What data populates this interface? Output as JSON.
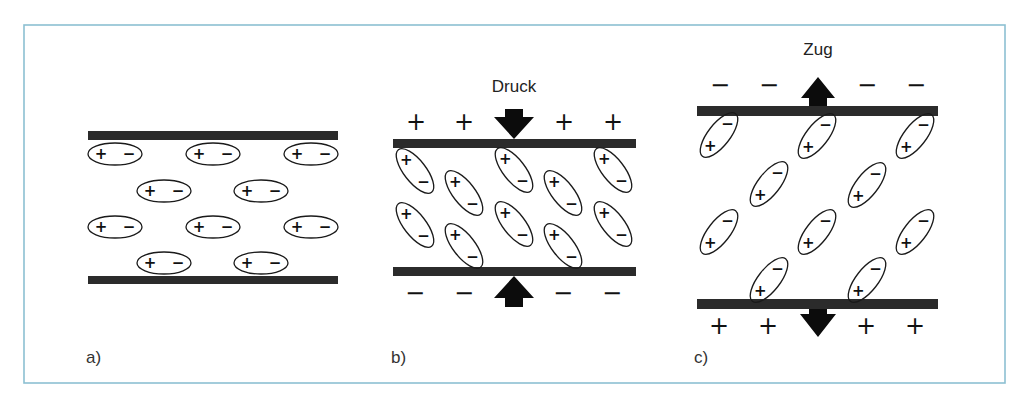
{
  "frame": {
    "x": 24,
    "y": 25,
    "width": 981,
    "height": 358,
    "color": "#8cc0d2"
  },
  "ellipse": {
    "rx": 27,
    "ry": 11,
    "tilted_rx": 27,
    "tilted_ry": 11
  },
  "panels": [
    {
      "id": "a",
      "label": "a)",
      "label_pos": [
        86,
        363
      ],
      "force_label": "",
      "plates": [
        {
          "x": 88,
          "y": 131,
          "w": 250,
          "h": 9
        },
        {
          "x": 88,
          "y": 276,
          "w": 250,
          "h": 8
        }
      ],
      "dipole_angle": 0,
      "dipole_order": [
        "+",
        "−"
      ],
      "dipoles": [
        [
          115,
          154
        ],
        [
          213,
          154
        ],
        [
          311,
          154
        ],
        [
          164,
          191
        ],
        [
          261,
          191
        ],
        [
          115,
          227
        ],
        [
          213,
          227
        ],
        [
          311,
          227
        ],
        [
          164,
          263
        ],
        [
          261,
          263
        ]
      ],
      "outer_top": [],
      "outer_bottom": [],
      "arrows": []
    },
    {
      "id": "b",
      "label": "b)",
      "label_pos": [
        391,
        363
      ],
      "force_label": "Druck",
      "force_label_pos": [
        514,
        92
      ],
      "plates": [
        {
          "x": 393,
          "y": 139,
          "w": 243,
          "h": 9
        },
        {
          "x": 393,
          "y": 267,
          "w": 243,
          "h": 9
        }
      ],
      "dipole_angle": 52,
      "dipole_order": [
        "+",
        "−"
      ],
      "dipoles": [
        [
          415,
          171
        ],
        [
          514,
          170
        ],
        [
          613,
          170
        ],
        [
          464,
          193
        ],
        [
          563,
          193
        ],
        [
          415,
          225
        ],
        [
          514,
          224
        ],
        [
          613,
          224
        ],
        [
          464,
          246
        ],
        [
          563,
          246
        ]
      ],
      "outer_top": {
        "symbol": "+",
        "y": 122,
        "xs": [
          416,
          464,
          564,
          613
        ]
      },
      "outer_bottom": {
        "symbol": "−",
        "y": 293,
        "xs": [
          415,
          464,
          563,
          612
        ]
      },
      "arrows": [
        {
          "direction": "down",
          "x": 514,
          "shaft_top": 109,
          "head_top": 117,
          "tip": 139,
          "shaft_half": 9,
          "head_half": 20
        },
        {
          "direction": "up",
          "x": 514,
          "shaft_bottom": 307,
          "head_bottom": 298,
          "tip": 276,
          "shaft_half": 9,
          "head_half": 20
        }
      ]
    },
    {
      "id": "c",
      "label": "c)",
      "label_pos": [
        694,
        363
      ],
      "force_label": "Zug",
      "force_label_pos": [
        818,
        55
      ],
      "plates": [
        {
          "x": 697,
          "y": 106,
          "w": 241,
          "h": 10
        },
        {
          "x": 697,
          "y": 299,
          "w": 241,
          "h": 10
        }
      ],
      "dipole_angle": -52,
      "dipole_order": [
        "+",
        "−"
      ],
      "dipoles": [
        [
          719,
          135
        ],
        [
          817,
          136
        ],
        [
          915,
          136
        ],
        [
          769,
          184
        ],
        [
          867,
          185
        ],
        [
          719,
          232
        ],
        [
          817,
          232
        ],
        [
          915,
          232
        ],
        [
          769,
          280
        ],
        [
          867,
          280
        ]
      ],
      "outer_top": {
        "symbol": "−",
        "y": 85,
        "xs": [
          720,
          769,
          867,
          916
        ]
      },
      "outer_bottom": {
        "symbol": "+",
        "y": 326,
        "xs": [
          719,
          768,
          866,
          915
        ]
      },
      "arrows": [
        {
          "direction": "up",
          "x": 818,
          "shaft_bottom": 106,
          "head_bottom": 98,
          "tip": 77,
          "shaft_half": 9,
          "head_half": 17
        },
        {
          "direction": "down",
          "x": 818,
          "shaft_top": 309,
          "head_top": 314,
          "tip": 337,
          "shaft_half": 9,
          "head_half": 18
        }
      ]
    }
  ]
}
